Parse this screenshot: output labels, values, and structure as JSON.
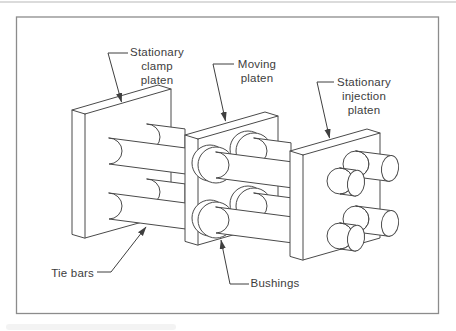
{
  "figure": {
    "colors": {
      "background": "#ffffff",
      "line": "#4a4a4a",
      "frame": "#8c8c8c",
      "text": "#3d3d3d"
    },
    "labels": {
      "clamp_platen": {
        "lines": [
          "Stationary",
          "clamp",
          "platen"
        ]
      },
      "moving_platen": {
        "lines": [
          "Moving",
          "platen"
        ]
      },
      "injection_platen": {
        "lines": [
          "Stationary",
          "injection",
          "platen"
        ]
      },
      "tie_bars": {
        "lines": [
          "Tie bars"
        ]
      },
      "bushings": {
        "lines": [
          "Bushings"
        ]
      }
    }
  }
}
